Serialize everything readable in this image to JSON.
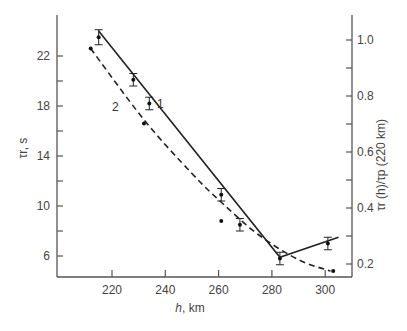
{
  "chart_data": {
    "type": "line",
    "title": "",
    "xlabel": "h, km",
    "ylabel": "τr, s",
    "ylabel_right": "τr (h)/τp (220 km)",
    "xlim": [
      200,
      310
    ],
    "ylim": [
      4.3,
      25.2
    ],
    "ylim_right": [
      0.15,
      1.09
    ],
    "x_ticks": [
      220,
      240,
      260,
      280,
      300
    ],
    "y_ticks": [
      6,
      10,
      14,
      18,
      22
    ],
    "y_minor_ticks": [
      8,
      12,
      16,
      20
    ],
    "y_right_ticks": [
      0.2,
      0.4,
      0.6,
      0.8,
      1.0
    ],
    "y_right_minor_ticks": [
      0.3,
      0.5,
      0.7,
      0.9
    ],
    "grid": false,
    "legend": "inline curve labels",
    "series": [
      {
        "name": "1",
        "style": "solid",
        "with_error_bars": true,
        "points": [
          {
            "x": 215,
            "y": 23.5,
            "err": 0.6
          },
          {
            "x": 228,
            "y": 20.1,
            "err": 0.5
          },
          {
            "x": 234,
            "y": 18.2,
            "err": 0.5
          },
          {
            "x": 261,
            "y": 10.9,
            "err": 0.5
          },
          {
            "x": 268,
            "y": 8.5,
            "err": 0.5
          },
          {
            "x": 283,
            "y": 5.8,
            "err": 0.5
          },
          {
            "x": 301,
            "y": 7.0,
            "err": 0.5
          }
        ],
        "line": [
          [
            215,
            24.0
          ],
          [
            283,
            5.9
          ],
          [
            305,
            7.5
          ]
        ]
      },
      {
        "name": "2",
        "style": "dashed",
        "with_error_bars": false,
        "points": [
          {
            "x": 212,
            "y": 22.6
          },
          {
            "x": 232,
            "y": 16.6
          },
          {
            "x": 261,
            "y": 8.8
          },
          {
            "x": 303,
            "y": 4.8
          }
        ],
        "line": [
          [
            212,
            22.6
          ],
          [
            232,
            16.9
          ],
          [
            250,
            12.6
          ],
          [
            261,
            10.3
          ],
          [
            275,
            7.7
          ],
          [
            290,
            5.7
          ],
          [
            302,
            4.8
          ]
        ]
      }
    ],
    "annotations": [
      {
        "text": "1",
        "x": 237,
        "y": 18.2
      },
      {
        "text": "2",
        "x": 225,
        "y": 17.9
      }
    ]
  },
  "labels": {
    "xlabel_italic": "h",
    "xlabel_rest": ", km",
    "ylabel": "τr, s",
    "ylabel_right": "τr (h)/τp (220 km)",
    "curve1": "1",
    "curve2": "2"
  }
}
